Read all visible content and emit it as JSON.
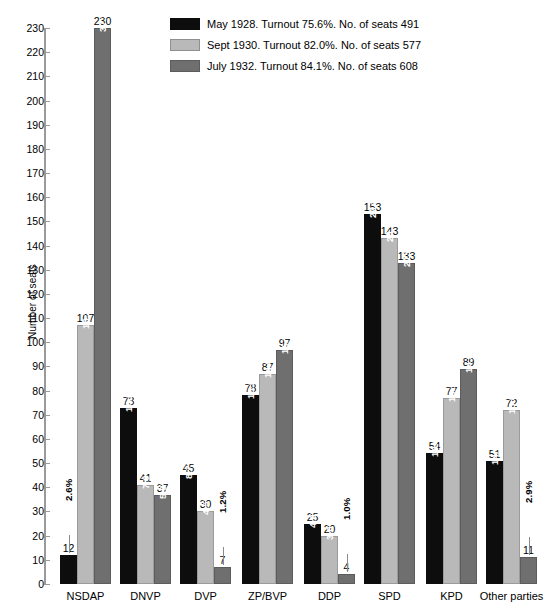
{
  "chart_data": {
    "type": "bar",
    "title": "",
    "xlabel": "",
    "ylabel": "Number of seats",
    "ylim": [
      0,
      230
    ],
    "ytick_step": 10,
    "grid": false,
    "legend_position": "top-center",
    "categories": [
      "NSDAP",
      "DNVP",
      "DVP",
      "ZP/BVP",
      "DDP",
      "SPD",
      "KPD",
      "Other parties"
    ],
    "series": [
      {
        "name": "May 1928. Turnout 75.6%. No. of seats 491",
        "short_name": "May 1928",
        "turnout": "75.6%",
        "total_seats": 491,
        "color": "#0d0d0d",
        "values": [
          12,
          73,
          45,
          78,
          25,
          153,
          54,
          51
        ],
        "percents": [
          "2.6%",
          "14.2%",
          "8.7%",
          "15.2%",
          "4.9%",
          "29.8%",
          "10.8%",
          "14.0%"
        ]
      },
      {
        "name": "Sept 1930. Turnout 82.0%. No. of seats 577",
        "short_name": "Sept 1930",
        "turnout": "82.0%",
        "total_seats": 577,
        "color": "#b9b9b9",
        "values": [
          107,
          41,
          30,
          87,
          20,
          143,
          77,
          72
        ],
        "percents": [
          "18.3%",
          "7.0%",
          "4.5%",
          "14.8%",
          "3.8%",
          "24.5%",
          "13.1%",
          "13.8%"
        ]
      },
      {
        "name": "July 1932. Turnout 84.1%. No. of seats 608",
        "short_name": "July 1932",
        "turnout": "84.1%",
        "total_seats": 608,
        "color": "#6f6f6f",
        "values": [
          230,
          37,
          7,
          97,
          4,
          133,
          89,
          11
        ],
        "percents": [
          "37.3%",
          "5.9%",
          "1.2%",
          "15.7%",
          "1.0%",
          "21.6%",
          "14.3%",
          "2.9%"
        ]
      }
    ],
    "ytick_labels": [
      "0",
      "10",
      "20",
      "30",
      "40",
      "50",
      "60",
      "70",
      "80",
      "90",
      "100",
      "110",
      "120",
      "130",
      "140",
      "150",
      "160",
      "170",
      "180",
      "190",
      "200",
      "210",
      "220",
      "230"
    ]
  },
  "legend": {
    "items": [
      {
        "label": "May 1928. Turnout 75.6%. No. of seats 491",
        "color": "#0d0d0d"
      },
      {
        "label": "Sept 1930. Turnout 82.0%. No. of seats 577",
        "color": "#b9b9b9"
      },
      {
        "label": "July 1932. Turnout 84.1%. No. of seats 608",
        "color": "#6f6f6f"
      }
    ]
  },
  "axes": {
    "y_title": "Number of seats"
  }
}
